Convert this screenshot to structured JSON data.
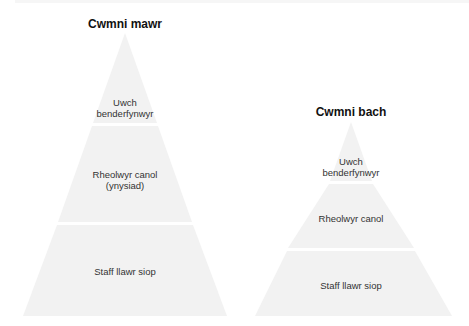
{
  "colors": {
    "tier_fill": "#f2f2f2",
    "title": "#111111",
    "label": "#333333"
  },
  "diagrams": [
    {
      "title": "Cwmni mawr",
      "tiers": [
        {
          "label_lines": [
            "Uwch",
            "benderfynwyr"
          ]
        },
        {
          "label_lines": [
            "Rheolwyr canol",
            "(ynysiad)"
          ]
        },
        {
          "label_lines": [
            "Staff llawr siop"
          ]
        }
      ]
    },
    {
      "title": "Cwmni bach",
      "tiers": [
        {
          "label_lines": [
            "Uwch",
            "benderfynwyr"
          ]
        },
        {
          "label_lines": [
            "Rheolwyr canol"
          ]
        },
        {
          "label_lines": [
            "Staff llawr siop"
          ]
        }
      ]
    }
  ]
}
